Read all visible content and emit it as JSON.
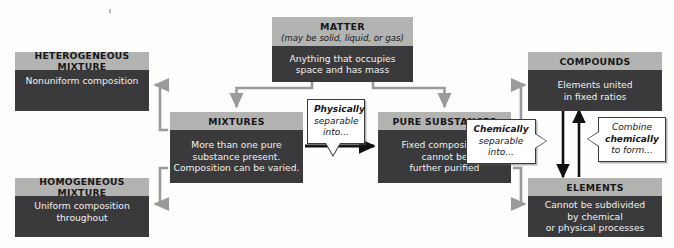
{
  "diagram": {
    "colors": {
      "header_gray": "#b3b3b1",
      "body_dark": "#3a3a3c",
      "body_text": "#f2f1ee",
      "arrow_gray": "#9a9a98",
      "arrow_black": "#111114",
      "callout_bg": "#ffffff",
      "callout_border": "#3b3b3d",
      "page_bg": "#fdfdfb"
    }
  },
  "boxes": {
    "matter": {
      "title": "MATTER",
      "subtitle": "(may be solid, liquid, or gas)",
      "line1": "Anything that occupies",
      "line2": "space and has mass"
    },
    "heterogeneous_mixture": {
      "title": "HETEROGENEOUS MIXTURE",
      "line1": "Nonuniform composition"
    },
    "homogeneous_mixture": {
      "title": "HOMOGENEOUS MIXTURE",
      "line1": "Uniform composition",
      "line2": "throughout"
    },
    "mixtures": {
      "title": "MIXTURES",
      "line1": "More than one pure",
      "line2": "substance present.",
      "line3": "Composition can be varied."
    },
    "pure_substances": {
      "title": "PURE SUBSTANCES",
      "line1": "Fixed composition;",
      "line2": "cannot be",
      "line3": "further purified"
    },
    "compounds": {
      "title": "COMPOUNDS",
      "line1": "Elements united",
      "line2": "in fixed ratios"
    },
    "elements": {
      "title": "ELEMENTS",
      "line1": "Cannot be subdivided",
      "line2": "by chemical",
      "line3": "or physical processes"
    }
  },
  "callouts": {
    "physically": {
      "emphasis": "Physically",
      "line1": "separable",
      "line2": "into..."
    },
    "chemically": {
      "emphasis": "Chemically",
      "line1": "separable",
      "line2": "into..."
    },
    "combine": {
      "line1": "Combine",
      "emphasis": "chemically",
      "line2": "to form..."
    }
  }
}
